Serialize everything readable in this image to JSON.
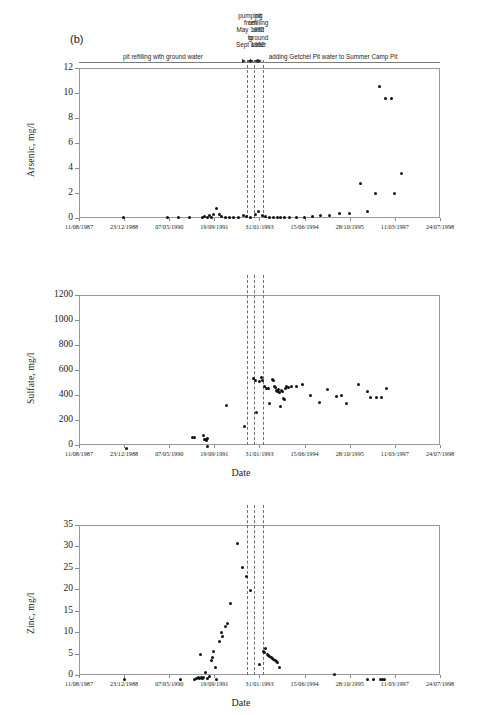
{
  "figure": {
    "panel_letter": "(b)",
    "xaxis_title": "Date",
    "date_ticks": [
      "11/08/1987",
      "23/12/1988",
      "07/05/1990",
      "19/09/1991",
      "31/01/1993",
      "15/06/1994",
      "28/10/1995",
      "11/03/1997",
      "24/07/1998"
    ],
    "annotations": {
      "left_phase": "pit refilling with ground water",
      "pumping_stack": "pumping\nfrom\nMay 1992\nto\nSept 1992",
      "pumping_lines": [
        "pumping",
        "from",
        "May 1992",
        "to",
        "Sept 1992"
      ],
      "refill_stack": "pit\nrefilling\nwith\nground\nwater",
      "refill_lines": [
        "pit",
        "refilling",
        "with",
        "ground",
        "water"
      ],
      "right_phase": "adding Getchel Pit water to Summer Camp Pit"
    },
    "marker_color": "#111111",
    "frame_color": "#9a9a9a",
    "vline_color": "#6e6e6e"
  },
  "chart_data": [
    {
      "type": "scatter",
      "title": "",
      "xlabel": "Date",
      "ylabel": "Arsenic, mg/l",
      "ylim": [
        0,
        12
      ],
      "yticks": [
        0,
        2,
        4,
        6,
        8,
        10,
        12
      ],
      "xlim_dates": [
        "11/08/1987",
        "24/07/1998"
      ],
      "xticks": [
        "11/08/1987",
        "23/12/1988",
        "07/05/1990",
        "19/09/1991",
        "31/01/1993",
        "15/06/1994",
        "28/10/1995",
        "11/03/1997",
        "24/07/1998"
      ],
      "grid": false,
      "legend": "none",
      "points": [
        {
          "x": 1988.95,
          "y": 0.02
        },
        {
          "x": 1990.3,
          "y": 0.05
        },
        {
          "x": 1990.62,
          "y": 0.05
        },
        {
          "x": 1990.95,
          "y": 0.05
        },
        {
          "x": 1991.35,
          "y": 0.05
        },
        {
          "x": 1991.42,
          "y": 0.1
        },
        {
          "x": 1991.5,
          "y": 0.06
        },
        {
          "x": 1991.58,
          "y": 0.2
        },
        {
          "x": 1991.62,
          "y": 0.08
        },
        {
          "x": 1991.7,
          "y": 0.3
        },
        {
          "x": 1991.78,
          "y": 0.78
        },
        {
          "x": 1991.86,
          "y": 0.32
        },
        {
          "x": 1991.92,
          "y": 0.12
        },
        {
          "x": 1992.05,
          "y": 0.06
        },
        {
          "x": 1992.18,
          "y": 0.06
        },
        {
          "x": 1992.3,
          "y": 0.06
        },
        {
          "x": 1992.45,
          "y": 0.06
        },
        {
          "x": 1992.6,
          "y": 0.2
        },
        {
          "x": 1992.7,
          "y": 0.14
        },
        {
          "x": 1992.82,
          "y": 0.08
        },
        {
          "x": 1992.95,
          "y": 0.3
        },
        {
          "x": 1993.05,
          "y": 0.5
        },
        {
          "x": 1993.18,
          "y": 0.22
        },
        {
          "x": 1993.28,
          "y": 0.1
        },
        {
          "x": 1993.4,
          "y": 0.08
        },
        {
          "x": 1993.52,
          "y": 0.08
        },
        {
          "x": 1993.62,
          "y": 0.07
        },
        {
          "x": 1993.72,
          "y": 0.07
        },
        {
          "x": 1993.85,
          "y": 0.07
        },
        {
          "x": 1994.0,
          "y": 0.06
        },
        {
          "x": 1994.2,
          "y": 0.06
        },
        {
          "x": 1994.45,
          "y": 0.06
        },
        {
          "x": 1994.7,
          "y": 0.12
        },
        {
          "x": 1994.95,
          "y": 0.22
        },
        {
          "x": 1995.2,
          "y": 0.2
        },
        {
          "x": 1995.5,
          "y": 0.4
        },
        {
          "x": 1995.8,
          "y": 0.38
        },
        {
          "x": 1996.15,
          "y": 2.8
        },
        {
          "x": 1996.35,
          "y": 0.52
        },
        {
          "x": 1996.6,
          "y": 2.0
        },
        {
          "x": 1996.72,
          "y": 10.5
        },
        {
          "x": 1996.9,
          "y": 9.6
        },
        {
          "x": 1997.1,
          "y": 9.55
        },
        {
          "x": 1997.18,
          "y": 1.95
        },
        {
          "x": 1997.38,
          "y": 3.55
        }
      ]
    },
    {
      "type": "scatter",
      "title": "",
      "xlabel": "Date",
      "ylabel": "Sulfate, mg/l",
      "ylim": [
        0,
        1200
      ],
      "yticks": [
        0,
        200,
        400,
        600,
        800,
        1000,
        1200
      ],
      "xlim_dates": [
        "11/08/1987",
        "24/07/1998"
      ],
      "xticks": [
        "11/08/1987",
        "23/12/1988",
        "07/05/1990",
        "19/09/1991",
        "31/01/1993",
        "15/06/1994",
        "28/10/1995",
        "11/03/1997",
        "24/07/1998"
      ],
      "grid": false,
      "legend": "none",
      "points": [
        {
          "x": 1989.05,
          "y": -25
        },
        {
          "x": 1991.05,
          "y": 62
        },
        {
          "x": 1991.1,
          "y": 58
        },
        {
          "x": 1991.4,
          "y": 80
        },
        {
          "x": 1991.42,
          "y": 48
        },
        {
          "x": 1991.45,
          "y": 42
        },
        {
          "x": 1991.48,
          "y": 35
        },
        {
          "x": 1991.5,
          "y": 52
        },
        {
          "x": 1991.52,
          "y": -8
        },
        {
          "x": 1992.08,
          "y": 318
        },
        {
          "x": 1992.62,
          "y": 145
        },
        {
          "x": 1992.9,
          "y": 530
        },
        {
          "x": 1992.95,
          "y": 520
        },
        {
          "x": 1993.0,
          "y": 262
        },
        {
          "x": 1993.1,
          "y": 505
        },
        {
          "x": 1993.15,
          "y": 540
        },
        {
          "x": 1993.18,
          "y": 515
        },
        {
          "x": 1993.25,
          "y": 470
        },
        {
          "x": 1993.3,
          "y": 455
        },
        {
          "x": 1993.35,
          "y": 450
        },
        {
          "x": 1993.38,
          "y": 332
        },
        {
          "x": 1993.48,
          "y": 525
        },
        {
          "x": 1993.52,
          "y": 520
        },
        {
          "x": 1993.55,
          "y": 472
        },
        {
          "x": 1993.58,
          "y": 462
        },
        {
          "x": 1993.6,
          "y": 440
        },
        {
          "x": 1993.63,
          "y": 430
        },
        {
          "x": 1993.66,
          "y": 448
        },
        {
          "x": 1993.7,
          "y": 420
        },
        {
          "x": 1993.72,
          "y": 305
        },
        {
          "x": 1993.75,
          "y": 438
        },
        {
          "x": 1993.78,
          "y": 425
        },
        {
          "x": 1993.8,
          "y": 372
        },
        {
          "x": 1993.83,
          "y": 368
        },
        {
          "x": 1993.86,
          "y": 455
        },
        {
          "x": 1993.9,
          "y": 468
        },
        {
          "x": 1993.95,
          "y": 462
        },
        {
          "x": 1994.05,
          "y": 470
        },
        {
          "x": 1994.22,
          "y": 472
        },
        {
          "x": 1994.4,
          "y": 488
        },
        {
          "x": 1994.62,
          "y": 398
        },
        {
          "x": 1994.9,
          "y": 342
        },
        {
          "x": 1995.15,
          "y": 445
        },
        {
          "x": 1995.42,
          "y": 385
        },
        {
          "x": 1995.58,
          "y": 395
        },
        {
          "x": 1995.72,
          "y": 335
        },
        {
          "x": 1996.1,
          "y": 488
        },
        {
          "x": 1996.35,
          "y": 432
        },
        {
          "x": 1996.45,
          "y": 378
        },
        {
          "x": 1996.62,
          "y": 378
        },
        {
          "x": 1996.8,
          "y": 378
        },
        {
          "x": 1996.95,
          "y": 455
        }
      ]
    },
    {
      "type": "scatter",
      "title": "",
      "xlabel": "Date",
      "ylabel": "Zinc, mg/l",
      "ylim": [
        0,
        35
      ],
      "yticks": [
        0,
        5,
        10,
        15,
        20,
        25,
        30,
        35
      ],
      "xlim_dates": [
        "11/08/1987",
        "24/07/1998"
      ],
      "xticks": [
        "11/08/1987",
        "23/12/1988",
        "07/05/1990",
        "19/09/1991",
        "31/01/1993",
        "15/06/1994",
        "28/10/1995",
        "11/03/1997",
        "24/07/1998"
      ],
      "grid": false,
      "legend": "none",
      "points": [
        {
          "x": 1989.0,
          "y": -1.0
        },
        {
          "x": 1990.7,
          "y": -1.0
        },
        {
          "x": 1991.1,
          "y": -1.0
        },
        {
          "x": 1991.18,
          "y": -0.9
        },
        {
          "x": 1991.24,
          "y": -0.6
        },
        {
          "x": 1991.28,
          "y": -0.7
        },
        {
          "x": 1991.32,
          "y": -0.5
        },
        {
          "x": 1991.36,
          "y": -0.8
        },
        {
          "x": 1991.4,
          "y": -0.6
        },
        {
          "x": 1991.3,
          "y": 4.7
        },
        {
          "x": 1991.44,
          "y": 0.7
        },
        {
          "x": 1991.52,
          "y": -0.8
        },
        {
          "x": 1991.58,
          "y": -0.4
        },
        {
          "x": 1991.62,
          "y": 3.5
        },
        {
          "x": 1991.66,
          "y": 4.2
        },
        {
          "x": 1991.7,
          "y": 5.4
        },
        {
          "x": 1991.74,
          "y": 1.7
        },
        {
          "x": 1991.78,
          "y": -1.0
        },
        {
          "x": 1991.86,
          "y": 7.8
        },
        {
          "x": 1991.92,
          "y": 9.9
        },
        {
          "x": 1991.96,
          "y": 9.0
        },
        {
          "x": 1992.05,
          "y": 11.4
        },
        {
          "x": 1992.12,
          "y": 12.1
        },
        {
          "x": 1992.2,
          "y": 16.7
        },
        {
          "x": 1992.42,
          "y": 30.8
        },
        {
          "x": 1992.58,
          "y": 25.1
        },
        {
          "x": 1992.68,
          "y": 23.0
        },
        {
          "x": 1992.8,
          "y": 19.7
        },
        {
          "x": 1993.08,
          "y": 2.4
        },
        {
          "x": 1993.2,
          "y": 5.6
        },
        {
          "x": 1993.24,
          "y": 5.2
        },
        {
          "x": 1993.28,
          "y": 6.2
        },
        {
          "x": 1993.32,
          "y": 4.9
        },
        {
          "x": 1993.36,
          "y": 4.6
        },
        {
          "x": 1993.4,
          "y": 4.4
        },
        {
          "x": 1993.44,
          "y": 4.2
        },
        {
          "x": 1993.48,
          "y": 3.9
        },
        {
          "x": 1993.52,
          "y": 3.6
        },
        {
          "x": 1993.56,
          "y": 3.4
        },
        {
          "x": 1993.6,
          "y": 3.2
        },
        {
          "x": 1993.64,
          "y": 3.0
        },
        {
          "x": 1993.68,
          "y": 1.8
        },
        {
          "x": 1995.35,
          "y": 0.2
        },
        {
          "x": 1996.35,
          "y": -1.0
        },
        {
          "x": 1996.55,
          "y": -1.0
        },
        {
          "x": 1996.75,
          "y": -1.0
        },
        {
          "x": 1996.82,
          "y": -1.0
        },
        {
          "x": 1996.88,
          "y": -1.0
        }
      ]
    }
  ]
}
